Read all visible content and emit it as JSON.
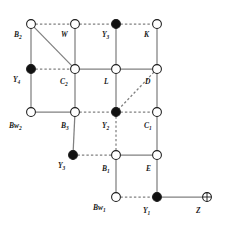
{
  "figure": {
    "width": 225,
    "height": 226,
    "background_color": "#ffffff",
    "edge_color": "#808080",
    "node_outline_color": "#1a1a1a",
    "label_color": "#1a1a1a",
    "node_fill_open": "#ffffff",
    "node_fill_filled": "#111111"
  },
  "nodes": [
    {
      "id": "B2",
      "label": "B",
      "sub": "2",
      "x": 31,
      "y": 24,
      "fill": "open",
      "label_x": 14,
      "label_y": 31,
      "shape": "circle"
    },
    {
      "id": "W",
      "label": "W",
      "sub": "",
      "x": 75,
      "y": 24,
      "fill": "open",
      "label_x": 61,
      "label_y": 31,
      "shape": "circle"
    },
    {
      "id": "Y3t",
      "label": "Y",
      "sub": "3",
      "x": 116,
      "y": 24,
      "fill": "filled",
      "label_x": 102,
      "label_y": 31,
      "shape": "circle"
    },
    {
      "id": "K",
      "label": "K",
      "sub": "",
      "x": 157,
      "y": 24,
      "fill": "open",
      "label_x": 144,
      "label_y": 31,
      "shape": "circle"
    },
    {
      "id": "Y4",
      "label": "Y",
      "sub": "4",
      "x": 31,
      "y": 69,
      "fill": "filled",
      "label_x": 13,
      "label_y": 76,
      "shape": "circle"
    },
    {
      "id": "C2",
      "label": "C",
      "sub": "2",
      "x": 75,
      "y": 69,
      "fill": "open",
      "label_x": 60,
      "label_y": 78,
      "shape": "circle"
    },
    {
      "id": "L",
      "label": "L",
      "sub": "",
      "x": 116,
      "y": 69,
      "fill": "open",
      "label_x": 104,
      "label_y": 78,
      "shape": "circle"
    },
    {
      "id": "D",
      "label": "D",
      "sub": "",
      "x": 157,
      "y": 69,
      "fill": "open",
      "label_x": 145,
      "label_y": 78,
      "shape": "circle"
    },
    {
      "id": "Bw2",
      "label": "Bw",
      "sub": "2",
      "x": 31,
      "y": 112,
      "fill": "open",
      "label_x": 9,
      "label_y": 122,
      "shape": "circle"
    },
    {
      "id": "B3",
      "label": "B",
      "sub": "3",
      "x": 75,
      "y": 112,
      "fill": "open",
      "label_x": 61,
      "label_y": 122,
      "shape": "circle"
    },
    {
      "id": "Y2",
      "label": "Y",
      "sub": "2",
      "x": 116,
      "y": 112,
      "fill": "filled",
      "label_x": 102,
      "label_y": 122,
      "shape": "circle"
    },
    {
      "id": "C1",
      "label": "C",
      "sub": "1",
      "x": 157,
      "y": 112,
      "fill": "open",
      "label_x": 144,
      "label_y": 122,
      "shape": "circle"
    },
    {
      "id": "Y3b",
      "label": "Y",
      "sub": "3",
      "x": 73,
      "y": 155,
      "fill": "filled",
      "label_x": 58,
      "label_y": 162,
      "shape": "circle"
    },
    {
      "id": "B1",
      "label": "B",
      "sub": "1",
      "x": 116,
      "y": 155,
      "fill": "open",
      "label_x": 102,
      "label_y": 165,
      "shape": "circle"
    },
    {
      "id": "E",
      "label": "E",
      "sub": "",
      "x": 157,
      "y": 155,
      "fill": "open",
      "label_x": 146,
      "label_y": 165,
      "shape": "circle"
    },
    {
      "id": "Bw1",
      "label": "Bw",
      "sub": "1",
      "x": 116,
      "y": 197,
      "fill": "open",
      "label_x": 93,
      "label_y": 204,
      "shape": "circle"
    },
    {
      "id": "Y1",
      "label": "Y",
      "sub": "1",
      "x": 157,
      "y": 197,
      "fill": "filled",
      "label_x": 143,
      "label_y": 207,
      "shape": "circle"
    },
    {
      "id": "Z",
      "label": "Z",
      "sub": "",
      "x": 207,
      "y": 197,
      "fill": "crossed",
      "label_x": 196,
      "label_y": 207,
      "shape": "crossed-circle"
    }
  ],
  "edges": [
    {
      "from": "B2",
      "to": "W",
      "style": "dashed"
    },
    {
      "from": "W",
      "to": "Y3t",
      "style": "dashed"
    },
    {
      "from": "Y3t",
      "to": "K",
      "style": "dashed"
    },
    {
      "from": "B2",
      "to": "Y4",
      "style": "solid"
    },
    {
      "from": "B2",
      "to": "C2",
      "style": "solid"
    },
    {
      "from": "W",
      "to": "C2",
      "style": "solid"
    },
    {
      "from": "Y3t",
      "to": "L",
      "style": "solid"
    },
    {
      "from": "K",
      "to": "D",
      "style": "solid"
    },
    {
      "from": "Y4",
      "to": "C2",
      "style": "dashed"
    },
    {
      "from": "C2",
      "to": "L",
      "style": "solid"
    },
    {
      "from": "L",
      "to": "D",
      "style": "solid"
    },
    {
      "from": "Y4",
      "to": "Bw2",
      "style": "solid"
    },
    {
      "from": "C2",
      "to": "B3",
      "style": "solid"
    },
    {
      "from": "D",
      "to": "Y2",
      "style": "dashed"
    },
    {
      "from": "D",
      "to": "C1",
      "style": "solid"
    },
    {
      "from": "L",
      "to": "Y2",
      "style": "solid"
    },
    {
      "from": "Bw2",
      "to": "B3",
      "style": "solid"
    },
    {
      "from": "B3",
      "to": "Y2",
      "style": "dashed"
    },
    {
      "from": "Y2",
      "to": "C1",
      "style": "dashed"
    },
    {
      "from": "B3",
      "to": "Y3b",
      "style": "solid"
    },
    {
      "from": "Y2",
      "to": "B1",
      "style": "dashed"
    },
    {
      "from": "C1",
      "to": "E",
      "style": "solid"
    },
    {
      "from": "Y3b",
      "to": "B1",
      "style": "dashed"
    },
    {
      "from": "B1",
      "to": "E",
      "style": "solid"
    },
    {
      "from": "B1",
      "to": "Bw1",
      "style": "solid"
    },
    {
      "from": "E",
      "to": "Y1",
      "style": "solid"
    },
    {
      "from": "Bw1",
      "to": "Y1",
      "style": "dashed"
    },
    {
      "from": "Y1",
      "to": "Z",
      "style": "solid"
    }
  ]
}
